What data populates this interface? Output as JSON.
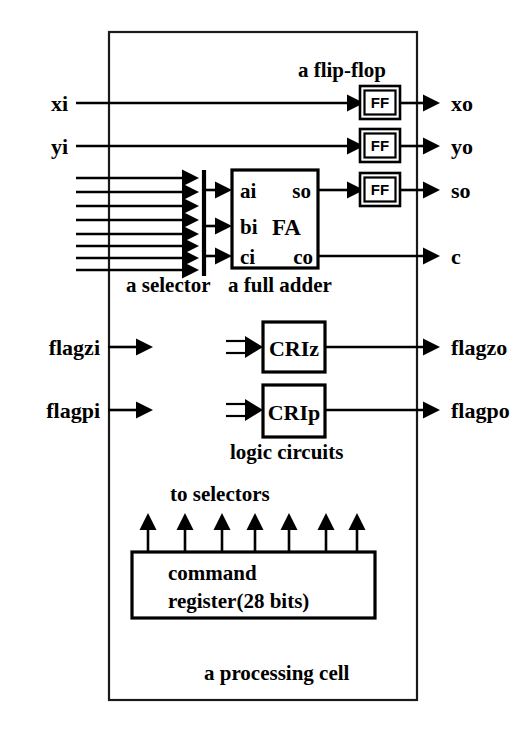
{
  "figure": {
    "title": "a processing cell",
    "caption_bottom": "a processing cell"
  },
  "cell_border": {
    "name": "processing-cell-boundary"
  },
  "inputs_left": [
    {
      "id": "xi",
      "label": "xi",
      "y": 103
    },
    {
      "id": "yi",
      "label": "yi",
      "y": 146
    },
    {
      "id": "flagzi",
      "label": "flagzi",
      "y": 347
    },
    {
      "id": "flagpi",
      "label": "flagpi",
      "y": 410
    }
  ],
  "outputs_right": [
    {
      "id": "xo",
      "label": "xo",
      "y": 103
    },
    {
      "id": "yo",
      "label": "yo",
      "y": 146
    },
    {
      "id": "so",
      "label": "so",
      "y": 190
    },
    {
      "id": "c",
      "label": "c",
      "y": 256
    },
    {
      "id": "flagzo",
      "label": "flagzo",
      "y": 347
    },
    {
      "id": "flagpo",
      "label": "flagpo",
      "y": 410
    }
  ],
  "flipflops": {
    "label": "FF",
    "caption": "a flip-flop",
    "items": [
      {
        "id": "ff-x",
        "y": 103
      },
      {
        "id": "ff-y",
        "y": 146
      },
      {
        "id": "ff-s",
        "y": 190
      }
    ]
  },
  "full_adder": {
    "caption": "a full adder",
    "name_label": "FA",
    "inputs": [
      {
        "id": "ai",
        "label": "ai",
        "y": 190
      },
      {
        "id": "bi",
        "label": "bi",
        "y": 226
      },
      {
        "id": "ci",
        "label": "ci",
        "y": 256
      }
    ],
    "outputs": [
      {
        "id": "so",
        "label": "so",
        "y": 190
      },
      {
        "id": "co",
        "label": "co",
        "y": 256
      }
    ]
  },
  "selector": {
    "caption": "a selector",
    "groups": [
      {
        "id": "selector-upper",
        "feed_count": 6,
        "outputs": [
          "ai",
          "bi"
        ]
      },
      {
        "id": "selector-lower",
        "feed_count": 2,
        "outputs": [
          "ci"
        ]
      }
    ],
    "bus_line_count": 8
  },
  "logic_circuits": {
    "caption": "logic circuits",
    "blocks": [
      {
        "id": "criz",
        "label": "CRIz",
        "y": 347,
        "input": "flagzi",
        "output": "flagzo"
      },
      {
        "id": "crip",
        "label": "CRIp",
        "y": 410,
        "input": "flagpi",
        "output": "flagpo"
      }
    ]
  },
  "command_register": {
    "line1": "command",
    "line2": "register(28 bits)",
    "fanout_caption": "to selectors",
    "fanout_arrow_count": 7
  },
  "colors": {
    "ink": "#000000",
    "paper": "#ffffff",
    "border": "#1a1a1a"
  }
}
